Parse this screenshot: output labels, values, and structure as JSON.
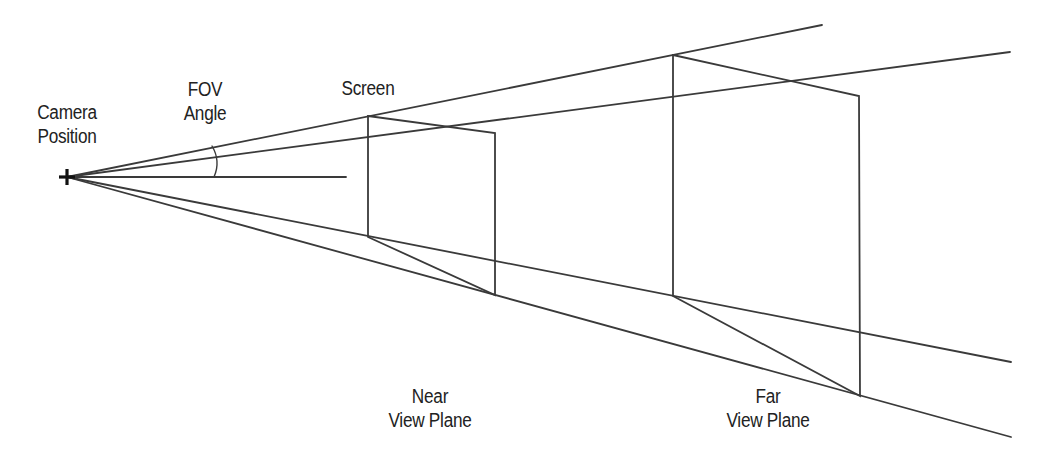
{
  "diagram": {
    "labels": {
      "camera": [
        "Camera",
        "Position"
      ],
      "fov": [
        "FOV",
        "Angle"
      ],
      "screen": "Screen",
      "near": [
        "Near",
        "View Plane"
      ],
      "far": [
        "Far",
        "View Plane"
      ]
    },
    "colors": {
      "line": "#3a3a3a",
      "text": "#222222",
      "background": "#ffffff"
    },
    "camera_position": [
      67,
      177
    ],
    "near_plane": {
      "top_left": [
        368,
        116
      ],
      "top_right": [
        495,
        133
      ],
      "bottom_left": [
        368,
        237
      ],
      "bottom_right": [
        495,
        295
      ]
    },
    "far_plane": {
      "top_left": [
        673,
        55
      ],
      "top_right": [
        859,
        96
      ],
      "bottom_left": [
        673,
        296
      ],
      "bottom_right": [
        860,
        396
      ]
    }
  }
}
